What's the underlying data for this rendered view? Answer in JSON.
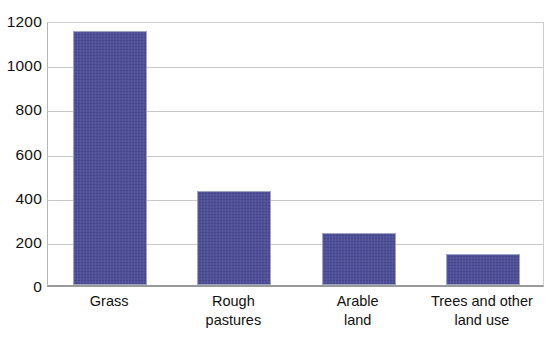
{
  "chart_data": {
    "type": "bar",
    "title": "",
    "subtitle": "",
    "xlabel": "",
    "ylabel": "",
    "categories": [
      "Grass",
      "Rough pastures",
      "Arable land",
      "Trees and other land use"
    ],
    "category_label_lines": [
      [
        "Grass"
      ],
      [
        "Rough",
        "pastures"
      ],
      [
        "Arable",
        "land"
      ],
      [
        "Trees and other",
        "land use"
      ]
    ],
    "values": [
      1150,
      425,
      235,
      140
    ],
    "ylim": [
      0,
      1200
    ],
    "y_ticks": [
      0,
      200,
      400,
      600,
      800,
      1000,
      1200
    ],
    "y_tick_labels": [
      "0",
      "200",
      "400",
      "600",
      "800",
      "1000",
      "1200"
    ],
    "grid": true,
    "grid_axis": "y",
    "legend": false,
    "legend_position": "none",
    "bar_color": "#4a4a96",
    "bar_border_color": "#9fa3c4",
    "gridline_color": "#c9c9c9",
    "axis_color": "#9a9a9a",
    "background_color": "#ffffff",
    "text_color": "#111111"
  }
}
